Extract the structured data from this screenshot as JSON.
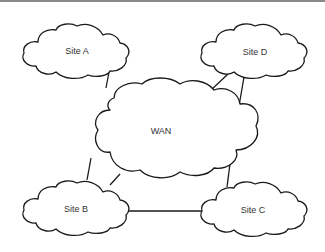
{
  "diagram": {
    "type": "network-topology",
    "nodes": [
      {
        "id": "site-a",
        "label": "Site A",
        "cx": 77,
        "cy": 51
      },
      {
        "id": "site-d",
        "label": "Site D",
        "cx": 255,
        "cy": 52
      },
      {
        "id": "wan",
        "label": "WAN",
        "cx": 161,
        "cy": 131
      },
      {
        "id": "site-b",
        "label": "Site B",
        "cx": 76,
        "cy": 209
      },
      {
        "id": "site-c",
        "label": "Site C",
        "cx": 253,
        "cy": 210
      }
    ],
    "edges": [
      {
        "from": "Site A",
        "to": "WAN"
      },
      {
        "from": "Site D",
        "to": "WAN"
      },
      {
        "from": "Site D",
        "to": "WAN"
      },
      {
        "from": "WAN",
        "to": "Site B"
      },
      {
        "from": "WAN",
        "to": "Site B"
      },
      {
        "from": "WAN",
        "to": "Site C"
      },
      {
        "from": "Site B",
        "to": "Site C"
      }
    ],
    "colors": {
      "stroke": "#1a1a1a",
      "fill": "#ffffff",
      "text": "#333333",
      "topbar": "#8a8a8a"
    }
  }
}
